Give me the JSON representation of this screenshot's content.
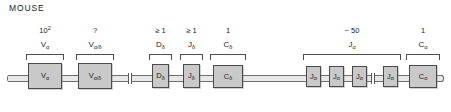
{
  "title": "MOUSE",
  "colors": {
    "segment_fill": "#c9c9c9",
    "segment_stroke": "#4a4a4a",
    "line_fill": "#e8e8e6",
    "line_stroke": "#6e6e6e",
    "text": "#1c1c1c"
  },
  "segments": [
    {
      "label": "V",
      "sub": "α",
      "x": 28,
      "y": 63,
      "w": 34,
      "h": 26
    },
    {
      "label": "V",
      "sub": "α/δ",
      "x": 78,
      "y": 63,
      "w": 34,
      "h": 26
    },
    {
      "label": "D",
      "sub": "δ",
      "x": 152,
      "y": 64,
      "w": 17,
      "h": 24
    },
    {
      "label": "J",
      "sub": "δ",
      "x": 183,
      "y": 64,
      "w": 17,
      "h": 24
    },
    {
      "label": "C",
      "sub": "δ",
      "x": 213,
      "y": 65,
      "w": 30,
      "h": 23
    },
    {
      "label": "J",
      "sub": "α",
      "x": 306,
      "y": 66,
      "w": 15,
      "h": 21
    },
    {
      "label": "J",
      "sub": "α",
      "x": 329,
      "y": 66,
      "w": 15,
      "h": 21
    },
    {
      "label": "J",
      "sub": "α",
      "x": 352,
      "y": 66,
      "w": 15,
      "h": 21
    },
    {
      "label": "J",
      "sub": "α",
      "x": 383,
      "y": 66,
      "w": 15,
      "h": 21
    },
    {
      "label": "C",
      "sub": "α",
      "x": 409,
      "y": 65,
      "w": 28,
      "h": 23
    }
  ],
  "breaks": [
    {
      "x": 128
    },
    {
      "x": 371
    }
  ],
  "annotations": [
    {
      "count": "10",
      "count_sup": "2",
      "name": "V",
      "name_sub": "α",
      "bracket_x": 26,
      "bracket_w": 38,
      "label_x": 26,
      "label_w": 38
    },
    {
      "count": "?",
      "count_sup": "",
      "name": "V",
      "name_sub": "α/δ",
      "bracket_x": 76,
      "bracket_w": 38,
      "label_x": 76,
      "label_w": 38
    },
    {
      "count": "≥ 1",
      "count_sup": "",
      "name": "D",
      "name_sub": "δ",
      "bracket_x": 149,
      "bracket_w": 23,
      "label_x": 146,
      "label_w": 29
    },
    {
      "count": "≥ 1",
      "count_sup": "",
      "name": "J",
      "name_sub": "δ",
      "bracket_x": 180,
      "bracket_w": 23,
      "label_x": 177,
      "label_w": 29
    },
    {
      "count": "1",
      "count_sup": "",
      "name": "C",
      "name_sub": "δ",
      "bracket_x": 210,
      "bracket_w": 36,
      "label_x": 210,
      "label_w": 36
    },
    {
      "count": "~ 50",
      "count_sup": "",
      "name": "J",
      "name_sub": "α",
      "bracket_x": 303,
      "bracket_w": 98,
      "label_x": 303,
      "label_w": 98
    },
    {
      "count": "1",
      "count_sup": "",
      "name": "C",
      "name_sub": "α",
      "bracket_x": 406,
      "bracket_w": 34,
      "label_x": 406,
      "label_w": 34
    }
  ]
}
